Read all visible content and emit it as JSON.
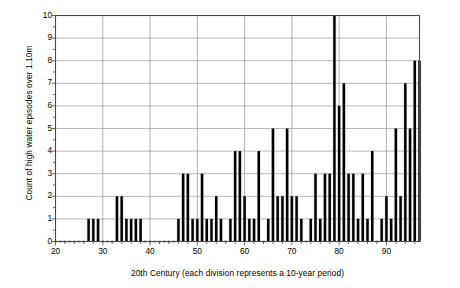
{
  "chart_data": {
    "type": "bar",
    "title": "",
    "xlabel": "20th Century (each division represents a 10-year period)",
    "ylabel": "Count of high water episodes over 1.10m",
    "xlim": [
      20,
      97
    ],
    "ylim": [
      0,
      10
    ],
    "grid": true,
    "legend": false,
    "ytick_labels": [
      "0",
      "1",
      "2",
      "3",
      "4",
      "5",
      "6",
      "7",
      "8",
      "9",
      "10"
    ],
    "ytick_values": [
      0,
      1,
      2,
      3,
      4,
      5,
      6,
      7,
      8,
      9,
      10
    ],
    "xtick_labels": [
      "20",
      "30",
      "40",
      "50",
      "60",
      "70",
      "80",
      "90"
    ],
    "xtick_values": [
      20,
      30,
      40,
      50,
      60,
      70,
      80,
      90
    ],
    "bar_color": "#000000",
    "categories": [
      20,
      21,
      22,
      23,
      24,
      25,
      26,
      27,
      28,
      29,
      30,
      31,
      32,
      33,
      34,
      35,
      36,
      37,
      38,
      39,
      40,
      41,
      42,
      43,
      44,
      45,
      46,
      47,
      48,
      49,
      50,
      51,
      52,
      53,
      54,
      55,
      56,
      57,
      58,
      59,
      60,
      61,
      62,
      63,
      64,
      65,
      66,
      67,
      68,
      69,
      70,
      71,
      72,
      73,
      74,
      75,
      76,
      77,
      78,
      79,
      80,
      81,
      82,
      83,
      84,
      85,
      86,
      87,
      88,
      89,
      90,
      91,
      92,
      93,
      94,
      95,
      96,
      97
    ],
    "values": [
      0,
      0,
      0,
      0,
      0,
      0,
      0,
      1,
      1,
      1,
      0,
      0,
      0,
      2,
      2,
      1,
      1,
      1,
      1,
      0,
      0,
      0,
      0,
      0,
      0,
      0,
      1,
      3,
      3,
      1,
      1,
      3,
      1,
      1,
      2,
      1,
      0,
      1,
      4,
      4,
      2,
      1,
      1,
      4,
      0,
      1,
      5,
      2,
      2,
      5,
      2,
      2,
      1,
      0,
      1,
      3,
      1,
      3,
      3,
      10,
      6,
      7,
      3,
      3,
      1,
      3,
      1,
      4,
      0,
      1,
      2,
      1,
      5,
      2,
      7,
      5,
      8,
      8
    ]
  }
}
